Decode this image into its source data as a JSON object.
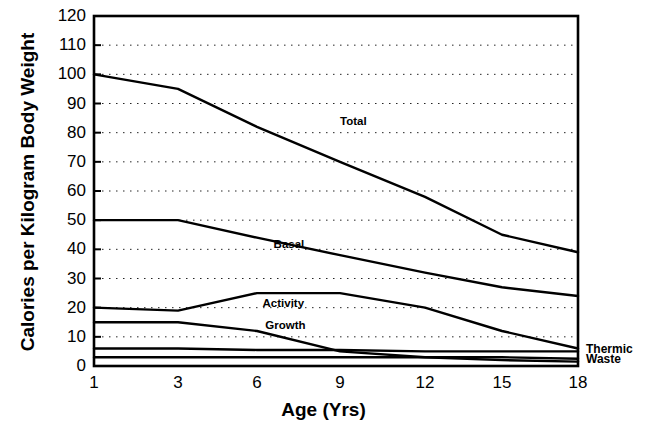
{
  "chart_data": {
    "type": "line",
    "title": "",
    "xlabel": "Age (Yrs)",
    "ylabel": "Calories per Kilogram Body Weight",
    "x": [
      1,
      3,
      6,
      9,
      12,
      15,
      18
    ],
    "xtick_labels": [
      "1",
      "3",
      "6",
      "9",
      "12",
      "15",
      "18"
    ],
    "ytick_labels": [
      "0",
      "10",
      "20",
      "30",
      "40",
      "50",
      "60",
      "70",
      "80",
      "90",
      "100",
      "110",
      "120"
    ],
    "xlim": [
      1,
      18
    ],
    "ylim": [
      0,
      120
    ],
    "grid": "horizontal-dotted",
    "legend_position": "inline-labels",
    "line_color": "#000000",
    "background": "#ffffff",
    "series": [
      {
        "name": "Total",
        "values": [
          100,
          95,
          82,
          70,
          58,
          45,
          39
        ],
        "label_x": 9.0,
        "label_y": 84
      },
      {
        "name": "Basal",
        "values": [
          50,
          50,
          44,
          38,
          32,
          27,
          24
        ],
        "label_x": 6.6,
        "label_y": 42
      },
      {
        "name": "Activity",
        "values": [
          20,
          19,
          25,
          25,
          20,
          12,
          6
        ],
        "label_x": 6.2,
        "label_y": 21.5
      },
      {
        "name": "Growth",
        "values": [
          15,
          15,
          12,
          5,
          3,
          2,
          1.5
        ],
        "label_x": 6.3,
        "label_y": 14
      },
      {
        "name": "Thermic",
        "values": [
          6,
          6,
          5.5,
          5.5,
          5,
          5,
          5
        ],
        "label_x": null,
        "label_y": null
      },
      {
        "name": "Waste",
        "values": [
          3,
          3,
          3,
          3,
          3,
          3,
          2.5
        ],
        "label_x": null,
        "label_y": null
      }
    ],
    "right_axis_labels": [
      {
        "text": "Thermic",
        "value": 6
      },
      {
        "text": "Waste",
        "value": 2.5
      }
    ]
  }
}
